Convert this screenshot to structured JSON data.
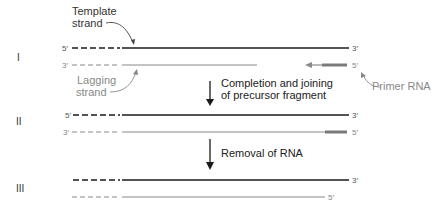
{
  "rows": [
    {
      "numeral": "I"
    },
    {
      "numeral": "II"
    },
    {
      "numeral": "III"
    }
  ],
  "labels": {
    "template_strand_line1": "Template",
    "template_strand_line2": "strand",
    "lagging_strand_line1": "Lagging",
    "lagging_strand_line2": "strand",
    "primer_rna": "Primer RNA",
    "step1_line1": "Completion and joining",
    "step1_line2": "of precursor fragment",
    "step2": "Removal of RNA",
    "five_prime": "5′",
    "three_prime": "3′"
  },
  "colors": {
    "template": "#1a1a1a",
    "lagging": "#8a8a8a",
    "primer": "#7a7a7a",
    "text": "#222222",
    "gray_text": "#888888"
  }
}
